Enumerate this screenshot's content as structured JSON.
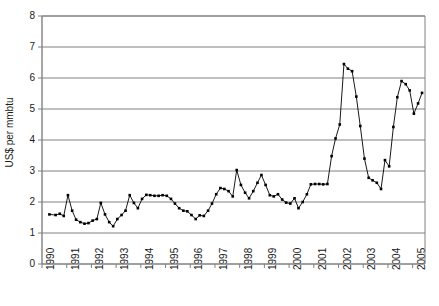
{
  "chart_data": {
    "type": "line",
    "title": "",
    "xlabel": "",
    "ylabel": "US$ per mmbtu",
    "ylim": [
      0,
      8
    ],
    "xlim": [
      1990.0,
      2005.5
    ],
    "grid": true,
    "legend": "none",
    "y_ticks": [
      0,
      1,
      2,
      3,
      4,
      5,
      6,
      7,
      8
    ],
    "y_tick_labels": [
      "0",
      "1",
      "2",
      "3",
      "4",
      "5",
      "6",
      "7",
      "8"
    ],
    "x_ticks": [
      1990,
      1991,
      1992,
      1993,
      1994,
      1995,
      1996,
      1997,
      1998,
      1999,
      2000,
      2001,
      2002,
      2003,
      2004,
      2005
    ],
    "x_tick_labels": [
      "1990",
      "1991",
      "1992",
      "1993",
      "1994",
      "1995",
      "1996",
      "1997",
      "1998",
      "1999",
      "2000",
      "2001",
      "2002",
      "2003",
      "2004",
      "2005"
    ],
    "marker": "filled-square",
    "line_color": "#000000",
    "marker_color": "#000000",
    "grid_color": "#808080",
    "axis_color": "#808080",
    "series": [
      {
        "name": "US$ per mmbtu",
        "x": [
          1990.3,
          1990.55,
          1990.72,
          1990.88,
          1991.05,
          1991.22,
          1991.38,
          1991.55,
          1991.72,
          1991.88,
          1992.05,
          1992.22,
          1992.38,
          1992.55,
          1992.72,
          1992.88,
          1993.05,
          1993.22,
          1993.38,
          1993.55,
          1993.72,
          1993.88,
          1994.05,
          1994.22,
          1994.38,
          1994.55,
          1994.72,
          1994.88,
          1995.05,
          1995.22,
          1995.38,
          1995.55,
          1995.72,
          1995.88,
          1996.05,
          1996.22,
          1996.38,
          1996.55,
          1996.72,
          1996.88,
          1997.05,
          1997.22,
          1997.38,
          1997.55,
          1997.72,
          1997.88,
          1998.05,
          1998.22,
          1998.38,
          1998.55,
          1998.72,
          1998.88,
          1999.05,
          1999.22,
          1999.38,
          1999.55,
          1999.72,
          1999.88,
          2000.05,
          2000.22,
          2000.38,
          2000.55,
          2000.72,
          2000.88,
          2001.05,
          2001.22,
          2001.38,
          2001.55,
          2001.72,
          2001.88,
          2002.05,
          2002.22,
          2002.38,
          2002.55,
          2002.72,
          2002.88,
          2003.05,
          2003.22,
          2003.38,
          2003.55,
          2003.72,
          2003.88,
          2004.05,
          2004.22,
          2004.38,
          2004.55,
          2004.72,
          2004.88,
          2005.05,
          2005.22,
          2005.38
        ],
        "values": [
          1.6,
          1.58,
          1.62,
          1.55,
          2.22,
          1.72,
          1.43,
          1.35,
          1.3,
          1.32,
          1.4,
          1.45,
          1.97,
          1.6,
          1.35,
          1.22,
          1.45,
          1.58,
          1.72,
          2.22,
          1.97,
          1.8,
          2.1,
          2.23,
          2.22,
          2.2,
          2.2,
          2.22,
          2.2,
          2.1,
          1.95,
          1.8,
          1.72,
          1.7,
          1.58,
          1.45,
          1.57,
          1.55,
          1.72,
          1.95,
          2.25,
          2.45,
          2.42,
          2.35,
          2.18,
          3.03,
          2.55,
          2.3,
          2.12,
          2.35,
          2.62,
          2.87,
          2.55,
          2.22,
          2.18,
          2.25,
          2.08,
          1.98,
          1.95,
          2.12,
          1.8,
          2.0,
          2.25,
          2.57,
          2.58,
          2.58,
          2.57,
          2.58,
          3.48,
          4.05,
          4.5,
          6.45,
          6.3,
          6.22,
          5.4,
          4.45,
          3.4,
          2.78,
          2.7,
          2.62,
          2.42,
          3.35,
          3.15,
          4.42,
          5.38,
          5.9,
          5.8,
          5.6,
          4.85,
          5.18,
          5.52
        ]
      }
    ]
  }
}
